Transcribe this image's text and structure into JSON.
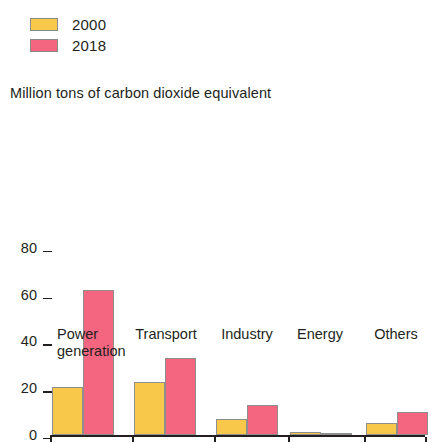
{
  "legend": {
    "items": [
      {
        "label": "2000",
        "color": "#f8c84a"
      },
      {
        "label": "2018",
        "color": "#f4657f"
      }
    ]
  },
  "subtitle": "Million tons of carbon dioxide equivalent",
  "chart_data": {
    "type": "bar",
    "title": "",
    "subtitle": "Million tons of carbon dioxide equivalent",
    "xlabel": "",
    "ylabel": "Million tons of carbon dioxide equivalent",
    "categories": [
      "Power\ngeneration",
      "Transport",
      "Industry",
      "Energy",
      "Others"
    ],
    "series": [
      {
        "name": "2000",
        "color": "#f8c84a",
        "values": [
          20.5,
          22.5,
          7,
          1.5,
          5
        ]
      },
      {
        "name": "2018",
        "color": "#f4657f",
        "values": [
          62,
          33,
          13,
          0.5,
          10
        ]
      }
    ],
    "ylim": [
      0,
      80
    ],
    "yticks": [
      0,
      20,
      40,
      60,
      80
    ],
    "ytick_labels": [
      "0",
      "20",
      "40",
      "60",
      "80"
    ],
    "grid": false,
    "legend_position": "top-left"
  }
}
